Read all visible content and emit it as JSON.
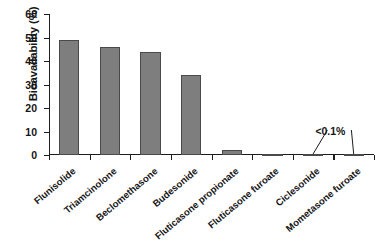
{
  "chart_data": {
    "type": "bar",
    "title": "",
    "xlabel": "",
    "ylabel": "Bioavailability (%)",
    "ylim": [
      0,
      60
    ],
    "yticks": [
      0,
      10,
      20,
      30,
      40,
      50,
      60
    ],
    "ytick_labels": [
      "0",
      "10",
      "20",
      "30",
      "40",
      "50",
      "60"
    ],
    "grid": false,
    "legend": "none",
    "categories": [
      "Flunisolide",
      "Triamcinolone",
      "Beclomethasone",
      "Budesonide",
      "Fluticasone propionate",
      "Fluticasone furoate",
      "Ciclesonide",
      "Mometasone furoate"
    ],
    "values": [
      49,
      46,
      44,
      34,
      2,
      0.5,
      0.05,
      0.05
    ],
    "bar_color": "#7e7e7e",
    "bar_edge_color": "#4a4a4a",
    "annotations": [
      {
        "text": "<0.1%",
        "points_to": [
          "Ciclesonide",
          "Mometasone furoate"
        ]
      }
    ]
  },
  "axis": {
    "y_title": "Bioavailability (%)"
  }
}
